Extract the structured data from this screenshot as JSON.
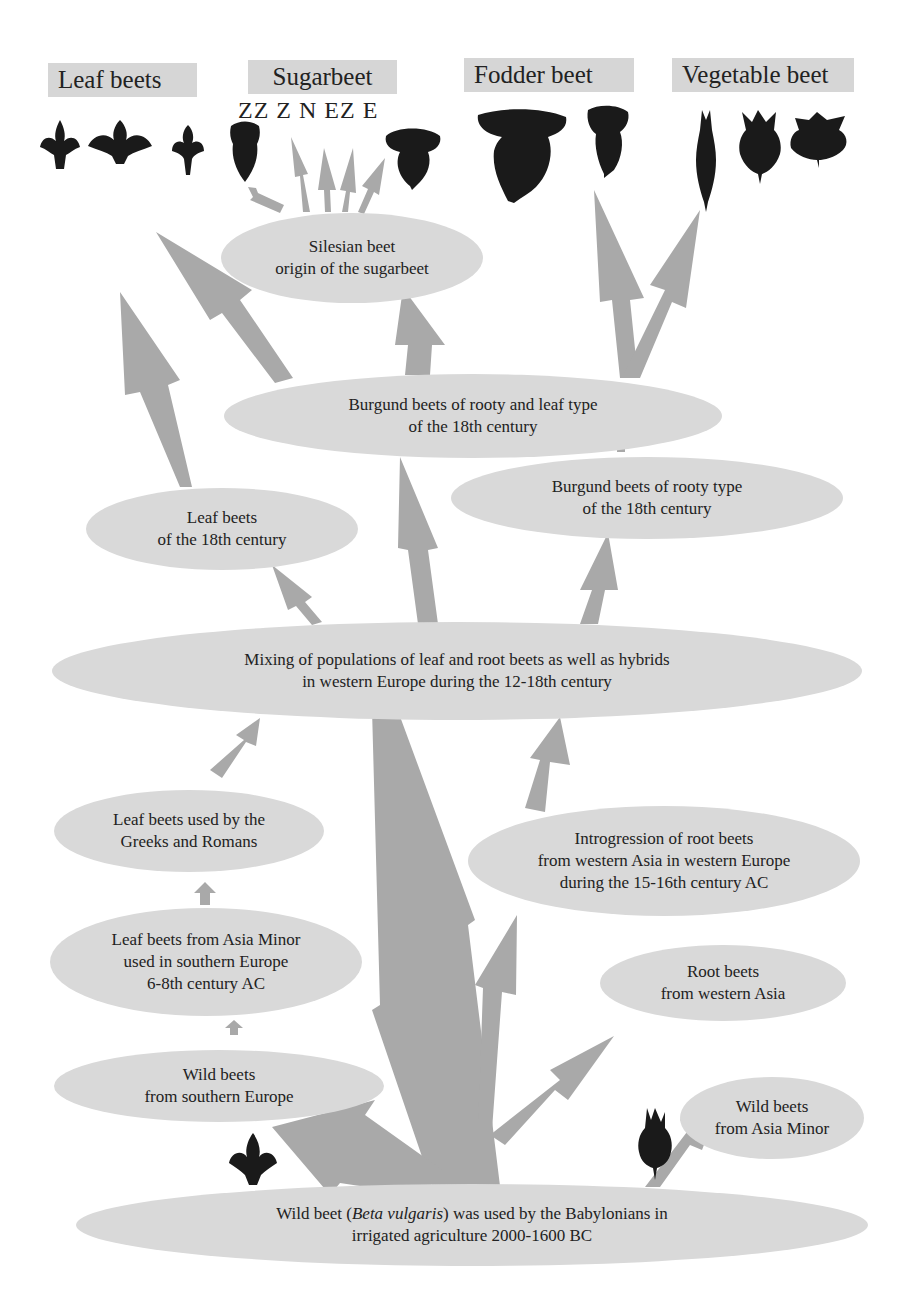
{
  "figure": {
    "colors": {
      "node_fill": "#d9d9d9",
      "arrow_fill": "#a9a9a9",
      "label_box": "#d6d6d6",
      "silhouette": "#1a1a1a"
    }
  },
  "categories": {
    "leaf_beets": "Leaf beets",
    "sugarbeet": "Sugarbeet",
    "sugarbeet_types": "ZZ  Z  N  EZ  E",
    "fodder_beet": "Fodder beet",
    "vegetable_beet": "Vegetable beet"
  },
  "nodes": {
    "silesian": {
      "line1": "Silesian beet",
      "line2": "origin of the sugarbeet"
    },
    "burgund_rooty_leaf": {
      "line1": "Burgund beets of rooty and leaf type",
      "line2": "of the 18th century"
    },
    "leaf_18th": {
      "line1": "Leaf beets",
      "line2": "of the 18th century"
    },
    "burgund_rooty": {
      "line1": "Burgund beets of rooty type",
      "line2": "of the 18th century"
    },
    "mixing": {
      "line1": "Mixing of populations of leaf and root beets as well as hybrids",
      "line2": "in western Europe during the 12-18th century"
    },
    "greeks_romans": {
      "line1": "Leaf beets used by the",
      "line2": "Greeks and Romans"
    },
    "introgression": {
      "line1": "Introgression of root beets",
      "line2": "from western Asia in western Europe",
      "line3": "during the 15-16th century AC"
    },
    "asia_minor_leaf": {
      "line1": "Leaf beets from Asia Minor",
      "line2": "used in southern Europe",
      "line3": "6-8th century AC"
    },
    "root_western_asia": {
      "line1": "Root beets",
      "line2": "from western Asia"
    },
    "wild_southern_europe": {
      "line1": "Wild beets",
      "line2": "from southern Europe"
    },
    "wild_asia_minor": {
      "line1": "Wild beets",
      "line2": "from Asia Minor"
    },
    "babylonian": {
      "pre": "Wild beet (",
      "species": "Beta vulgaris",
      "post": ") was used by the Babylonians in",
      "line2": "irrigated agriculture 2000-1600 BC"
    }
  }
}
